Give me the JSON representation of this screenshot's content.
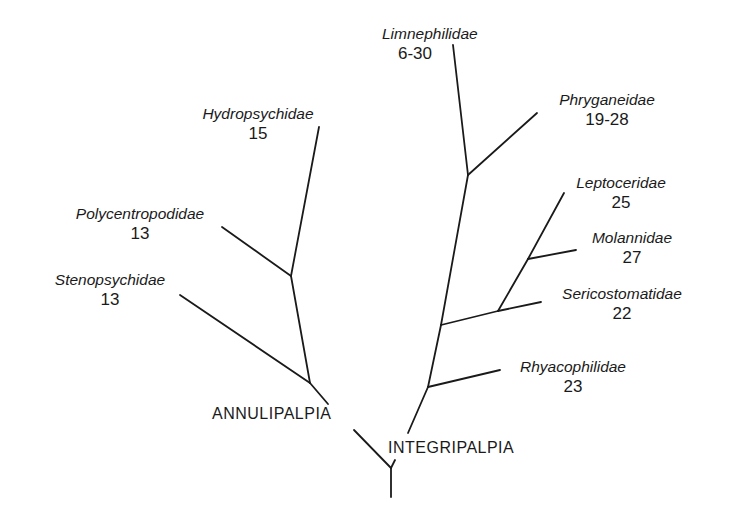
{
  "diagram": {
    "type": "phylogenetic-tree",
    "groups": {
      "annulipalpia": "ANNULIPALPIA",
      "integripalpia": "INTEGRIPALPIA"
    },
    "taxa": [
      {
        "name": "Hydropsychidae",
        "value": "15",
        "group": "ANNULIPALPIA"
      },
      {
        "name": "Polycentropodidae",
        "value": "13",
        "group": "ANNULIPALPIA"
      },
      {
        "name": "Stenopsychidae",
        "value": "13",
        "group": "ANNULIPALPIA"
      },
      {
        "name": "Limnephilidae",
        "value": "6-30",
        "group": "INTEGRIPALPIA"
      },
      {
        "name": "Phryganeidae",
        "value": "19-28",
        "group": "INTEGRIPALPIA"
      },
      {
        "name": "Leptoceridae",
        "value": "25",
        "group": "INTEGRIPALPIA"
      },
      {
        "name": "Molannidae",
        "value": "27",
        "group": "INTEGRIPALPIA"
      },
      {
        "name": "Sericostomatidae",
        "value": "22",
        "group": "INTEGRIPALPIA"
      },
      {
        "name": "Rhyacophilidae",
        "value": "23",
        "group": "INTEGRIPALPIA"
      }
    ]
  }
}
